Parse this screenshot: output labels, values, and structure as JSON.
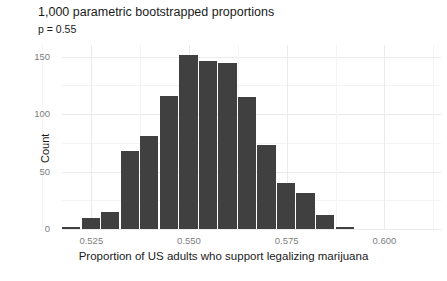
{
  "chart_data": {
    "type": "bar",
    "title": "1,000 parametric bootstrapped proportions",
    "subtitle": "p = 0.55",
    "xlabel": "Proportion of US adults who support legalizing marijuana",
    "ylabel": "Count",
    "xlim": [
      0.5175,
      0.6145
    ],
    "ylim": [
      0,
      160
    ],
    "grid": true,
    "legend": "none",
    "bar_color": "#404040",
    "bin_width": 0.005,
    "xticks": [
      "0.525",
      "0.550",
      "0.575",
      "0.600"
    ],
    "xtick_values": [
      0.525,
      0.55,
      0.575,
      0.6
    ],
    "yticks": [
      "0",
      "50",
      "100",
      "150"
    ],
    "ytick_values": [
      0,
      50,
      100,
      150
    ],
    "categories": [
      "0.5200",
      "0.5250",
      "0.5300",
      "0.5350",
      "0.5400",
      "0.5450",
      "0.5500",
      "0.5550",
      "0.5600",
      "0.5650",
      "0.5700",
      "0.5750",
      "0.5800",
      "0.5850",
      "0.5900"
    ],
    "bin_centers": [
      0.52,
      0.525,
      0.53,
      0.535,
      0.54,
      0.545,
      0.55,
      0.555,
      0.56,
      0.565,
      0.57,
      0.575,
      0.58,
      0.585,
      0.59
    ],
    "values": [
      2,
      10,
      15,
      68,
      81,
      116,
      151,
      146,
      144,
      115,
      73,
      40,
      31,
      12,
      2
    ],
    "total": 1000
  }
}
